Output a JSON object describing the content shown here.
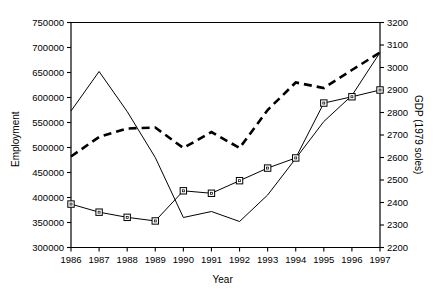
{
  "chart_data": {
    "type": "line",
    "title": "",
    "xlabel": "Year",
    "ylabel": "Employment",
    "ylabel_right": "GDP (1979 soles)",
    "x": [
      1986,
      1987,
      1988,
      1989,
      1990,
      1991,
      1992,
      1993,
      1994,
      1995,
      1996,
      1997
    ],
    "categories": [
      "1986",
      "1987",
      "1988",
      "1989",
      "1990",
      "1991",
      "1992",
      "1993",
      "1994",
      "1995",
      "1996",
      "1997"
    ],
    "ylim": [
      300000,
      750000
    ],
    "yticks": [
      300000,
      350000,
      400000,
      450000,
      500000,
      550000,
      600000,
      650000,
      700000,
      750000
    ],
    "ytick_labels": [
      "300000",
      "350000",
      "400000",
      "450000",
      "500000",
      "550000",
      "600000",
      "650000",
      "700000",
      "750000"
    ],
    "ylim_right": [
      2200,
      3200
    ],
    "yticks_right": [
      2200,
      2300,
      2400,
      2500,
      2600,
      2700,
      2800,
      2900,
      3000,
      3100,
      3200
    ],
    "ytick_labels_right": [
      "2200",
      "2300",
      "2400",
      "2500",
      "2600",
      "2700",
      "2800",
      "2900",
      "3000",
      "3100",
      "3200"
    ],
    "grid": false,
    "legend": "none",
    "series": [
      {
        "name": "employment-solid",
        "axis": "left",
        "style": "solid",
        "marker": "none",
        "color": "#000000",
        "values": [
          573000,
          652000,
          572000,
          480000,
          360000,
          372000,
          352000,
          405000,
          478000,
          552000,
          604000,
          690000
        ]
      },
      {
        "name": "employment-dashed",
        "axis": "left",
        "style": "dashed",
        "marker": "none",
        "color": "#000000",
        "values": [
          482000,
          521000,
          538000,
          540000,
          499000,
          531000,
          499000,
          575000,
          630000,
          619000,
          655000,
          690000
        ]
      },
      {
        "name": "gdp-squares",
        "axis": "right",
        "style": "solid",
        "marker": "square",
        "color": "#000000",
        "values": [
          2393,
          2357,
          2334,
          2318,
          2452,
          2441,
          2497,
          2553,
          2598,
          2842,
          2870,
          2900
        ]
      }
    ]
  },
  "axis": {
    "left_title": "Employment",
    "right_title": "GDP (1979 soles)",
    "bottom_title": "Year"
  }
}
